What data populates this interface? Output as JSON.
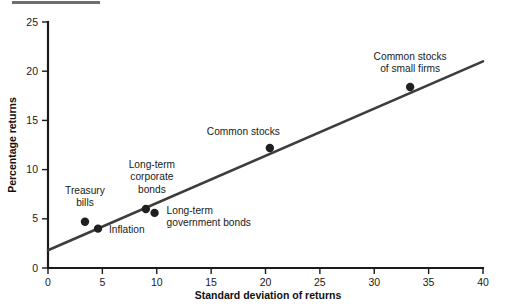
{
  "figure": {
    "top_rule_color": "#6e6e6e",
    "background_color": "#ffffff",
    "line_color": "#3d3d3d",
    "dot_color": "#1f1f1f",
    "axis_color": "#1a1a1a"
  },
  "chart_data": {
    "type": "scatter",
    "title": "",
    "xlabel": "Standard deviation of returns",
    "ylabel": "Percentage returns",
    "xlim": [
      0,
      40
    ],
    "ylim": [
      0,
      25
    ],
    "xticks": [
      0,
      5,
      10,
      15,
      20,
      25,
      30,
      35,
      40
    ],
    "yticks": [
      0,
      5,
      10,
      15,
      20,
      25
    ],
    "xtick_labels": [
      "0",
      "5",
      "10",
      "15",
      "20",
      "25",
      "30",
      "35",
      "40"
    ],
    "ytick_labels": [
      "0",
      "5",
      "10",
      "15",
      "20",
      "25"
    ],
    "grid": false,
    "legend": "none",
    "points": [
      {
        "label": "Treasury\nbills",
        "label_lines": [
          "Treasury",
          "bills"
        ],
        "x": 3.4,
        "y": 4.7,
        "label_anchor": "middle",
        "label_dx": 0,
        "label_dy": -28
      },
      {
        "label": "Inflation",
        "label_lines": [
          "Inflation"
        ],
        "x": 4.6,
        "y": 4.0,
        "label_anchor": "start",
        "label_dx": 11,
        "label_dy": 4
      },
      {
        "label": "Long-term\ncorporate\nbonds",
        "label_lines": [
          "Long-term",
          "corporate",
          "bonds"
        ],
        "x": 9.0,
        "y": 6.0,
        "label_anchor": "middle",
        "label_dx": 6,
        "label_dy": -41
      },
      {
        "label": "Long-term\ngovernment bonds",
        "label_lines": [
          "Long-term",
          "government bonds"
        ],
        "x": 9.8,
        "y": 5.6,
        "label_anchor": "start",
        "label_dx": 12,
        "label_dy": 1
      },
      {
        "label": "Common stocks",
        "label_lines": [
          "Common stocks"
        ],
        "x": 20.4,
        "y": 12.2,
        "label_anchor": "end",
        "label_dx": 10,
        "label_dy": -13
      },
      {
        "label": "Common stocks\nof small firms",
        "label_lines": [
          "Common stocks",
          "of small firms"
        ],
        "x": 33.3,
        "y": 18.4,
        "label_anchor": "middle",
        "label_dx": 0,
        "label_dy": -27
      }
    ],
    "trend_line": {
      "x_start": 0,
      "y_start": 1.8,
      "x_end": 40,
      "y_end": 21.0,
      "slope": 0.48,
      "intercept": 1.8
    }
  }
}
